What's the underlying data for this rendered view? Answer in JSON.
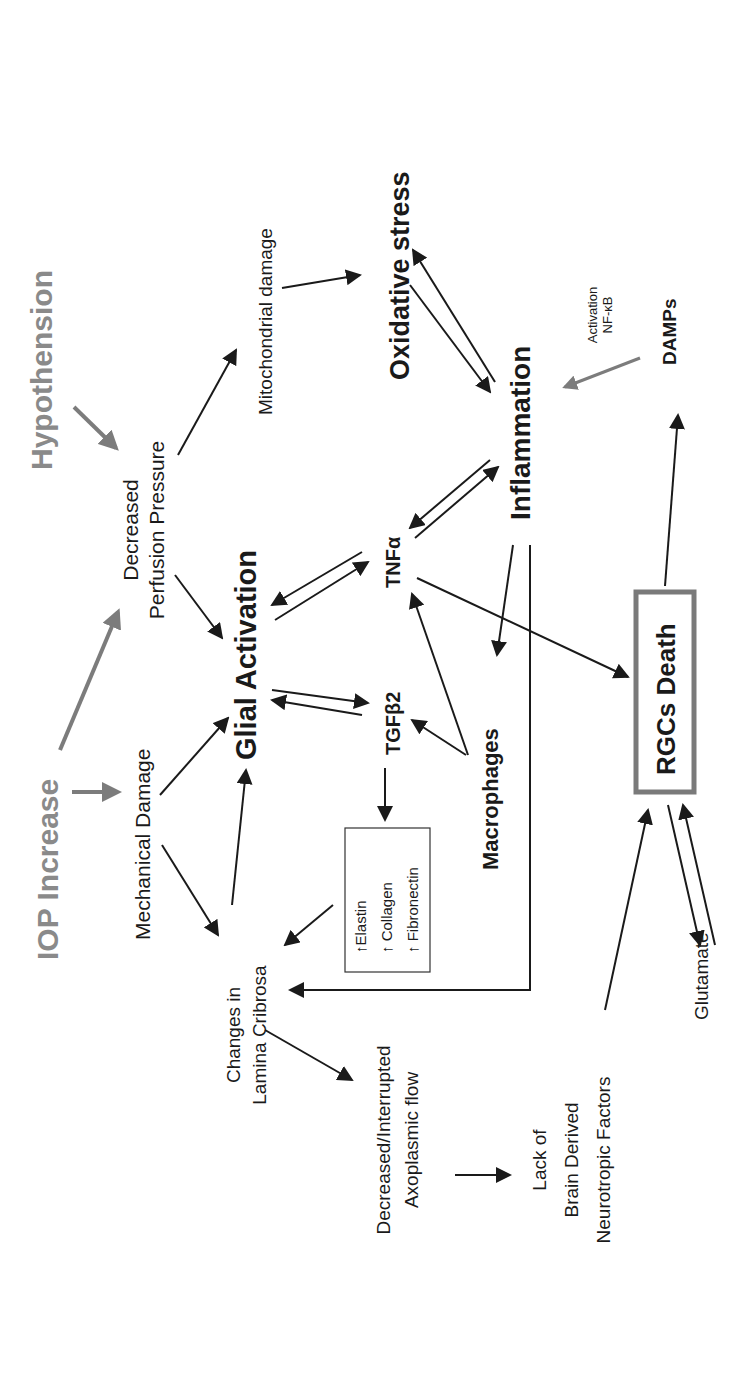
{
  "diagram": {
    "orientation": "rotated-90-ccw",
    "nodes": {
      "iop_increase": "IOP Increase",
      "hypothension": "Hypothension",
      "mechanical_damage": "Mechanical Damage",
      "decreased_perfusion_1": "Decreased",
      "decreased_perfusion_2": "Perfusion Pressure",
      "mitochondrial_damage": "Mitochondrial damage",
      "oxidative_stress": "Oxidative stress",
      "glial_activation": "Glial Activation",
      "tnf_alpha": "TNFα",
      "tgf_beta2": "TGFβ2",
      "inflammation": "Inflammation",
      "macrophages": "Macrophages",
      "changes_lamina_1": "Changes in",
      "changes_lamina_2": "Lamina Cribrosa",
      "ecm_box": [
        "↑Elastin",
        "↑ Collagen",
        "↑ Fibronectin"
      ],
      "activation_nfkb_1": "Activation",
      "activation_nfkb_2": "NF-κB",
      "damps": "DAMPs",
      "rgcs_death": "RGCs Death",
      "axoplasmic_1": "Decreased/Interrupted",
      "axoplasmic_2": "Axoplasmic flow",
      "bdnf_1": "Lack of",
      "bdnf_2": "Brain Derived",
      "bdnf_3": "Neurotropic Factors",
      "glutamate": "Glutamate"
    },
    "colors": {
      "primary_text": "#1a1a1a",
      "input_nodes": "#8a8a8a",
      "rgcs_box_border": "#7a7a7a"
    }
  }
}
